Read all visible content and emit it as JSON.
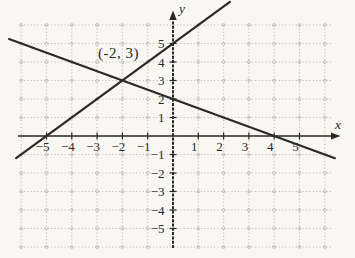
{
  "figure": {
    "background_color": "#f9f7f1"
  },
  "chart_data": {
    "type": "line",
    "title": "",
    "xlabel": "x",
    "ylabel": "y",
    "xlim": [
      -6,
      6
    ],
    "ylim": [
      -6,
      6
    ],
    "grid": true,
    "x_ticks": [
      -5,
      -4,
      -3,
      -2,
      -1,
      1,
      2,
      3,
      4,
      5
    ],
    "y_ticks": [
      5,
      4,
      3,
      2,
      1,
      -1,
      -2,
      -3,
      -4,
      -5
    ],
    "series": [
      {
        "name": "increasing-line",
        "equation": "y = x + 5",
        "slope": 1,
        "intercept": 5,
        "x_draw_range": [
          -6.2,
          2.25
        ],
        "points": [
          [
            -5,
            0
          ],
          [
            -2,
            3
          ],
          [
            0,
            5
          ]
        ]
      },
      {
        "name": "decreasing-line",
        "equation": "y = -x/2 + 2",
        "slope": -0.5,
        "intercept": 2,
        "x_draw_range": [
          -6.48,
          6.4
        ],
        "points": [
          [
            -2,
            3
          ],
          [
            0,
            2
          ],
          [
            4,
            0
          ]
        ]
      }
    ],
    "intersection": [
      -2,
      3
    ],
    "annotations": [
      {
        "text": "(-2, 3)",
        "at": [
          -2,
          3
        ],
        "label_pos": [
          -2.15,
          4.5
        ]
      }
    ],
    "colors": {
      "line": "#2b2a28",
      "axis": "#2b2927",
      "grid": "#aeaca6",
      "text": "#2b2927"
    }
  }
}
